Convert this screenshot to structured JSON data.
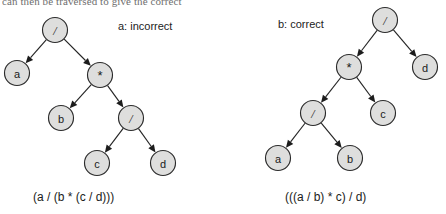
{
  "figure": {
    "partial_top_text": "can then be traversed to give the correct",
    "background_color": "#ffffff",
    "node_fill_color": "#dededd",
    "node_stroke_color": "#2b2b2b",
    "edge_color": "#242424",
    "text_color": "#1a1a1a"
  },
  "trees": [
    {
      "id": "tree-a",
      "label": "a: incorrect",
      "caption": "(a / (b * (c / d)))",
      "nodes": [
        {
          "id": "a-root",
          "text": "/",
          "kind": "operator",
          "x": 55,
          "y": 30
        },
        {
          "id": "a-n1",
          "text": "a",
          "kind": "operand",
          "x": 17,
          "y": 73
        },
        {
          "id": "a-n2",
          "text": "*",
          "kind": "operator",
          "x": 100,
          "y": 75
        },
        {
          "id": "a-n3",
          "text": "b",
          "kind": "operand",
          "x": 61,
          "y": 118
        },
        {
          "id": "a-n4",
          "text": "/",
          "kind": "operator",
          "x": 131,
          "y": 118
        },
        {
          "id": "a-n5",
          "text": "c",
          "kind": "operand",
          "x": 97,
          "y": 163
        },
        {
          "id": "a-n6",
          "text": "d",
          "kind": "operand",
          "x": 163,
          "y": 163
        }
      ],
      "edges": [
        {
          "from": "a-root",
          "to": "a-n1"
        },
        {
          "from": "a-root",
          "to": "a-n2"
        },
        {
          "from": "a-n2",
          "to": "a-n3"
        },
        {
          "from": "a-n2",
          "to": "a-n4"
        },
        {
          "from": "a-n4",
          "to": "a-n5"
        },
        {
          "from": "a-n4",
          "to": "a-n6"
        }
      ]
    },
    {
      "id": "tree-b",
      "label": "b: correct",
      "caption": "(((a / b) * c) / d)",
      "nodes": [
        {
          "id": "b-root",
          "text": "/",
          "kind": "operator",
          "x": 385,
          "y": 20
        },
        {
          "id": "b-n1",
          "text": "*",
          "kind": "operator",
          "x": 349,
          "y": 67
        },
        {
          "id": "b-n2",
          "text": "d",
          "kind": "operand",
          "x": 425,
          "y": 67
        },
        {
          "id": "b-n3",
          "text": "/",
          "kind": "operator",
          "x": 313,
          "y": 113
        },
        {
          "id": "b-n4",
          "text": "c",
          "kind": "operand",
          "x": 383,
          "y": 113
        },
        {
          "id": "b-n5",
          "text": "a",
          "kind": "operand",
          "x": 278,
          "y": 158
        },
        {
          "id": "b-n6",
          "text": "b",
          "kind": "operand",
          "x": 350,
          "y": 158
        }
      ],
      "edges": [
        {
          "from": "b-root",
          "to": "b-n1"
        },
        {
          "from": "b-root",
          "to": "b-n2"
        },
        {
          "from": "b-n1",
          "to": "b-n3"
        },
        {
          "from": "b-n1",
          "to": "b-n4"
        },
        {
          "from": "b-n3",
          "to": "b-n5"
        },
        {
          "from": "b-n3",
          "to": "b-n6"
        }
      ]
    }
  ],
  "geometry": {
    "node_radius": 12.5
  }
}
